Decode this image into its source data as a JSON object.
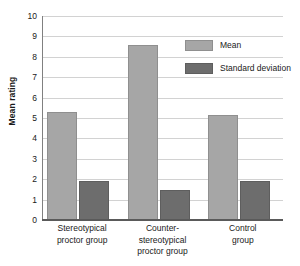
{
  "chart_data": {
    "type": "bar",
    "title": "",
    "xlabel": "",
    "ylabel": "Mean rating",
    "ylim": [
      0,
      10
    ],
    "yticks": [
      "10",
      "9",
      "8",
      "7",
      "6",
      "5",
      "4",
      "3",
      "2",
      "1",
      "0"
    ],
    "grid": true,
    "legend_position": "upper-right",
    "categories": [
      "Stereotypical proctor group",
      "Counter-stereotypical proctor group",
      "Control group"
    ],
    "category_lines": [
      [
        "Stereotypical",
        "proctor group"
      ],
      [
        "Counter-",
        "stereotypical",
        "proctor group"
      ],
      [
        "Control",
        "group"
      ]
    ],
    "series": [
      {
        "name": "Mean",
        "color": "#a6a6a6",
        "values": [
          5.3,
          8.6,
          5.15
        ]
      },
      {
        "name": "Standard deviation",
        "color": "#6d6d6d",
        "values": [
          1.9,
          1.45,
          1.9
        ]
      }
    ]
  },
  "legend": {
    "items": [
      {
        "label": "Mean",
        "key": "mean"
      },
      {
        "label": "Standard deviation",
        "key": "sd"
      }
    ]
  },
  "colors": {
    "mean_bar": "#a6a6a6",
    "sd_bar": "#6d6d6d",
    "gridline": "#d2d2d2",
    "axis": "#5a5a5a",
    "background": "#ffffff",
    "text": "#1a1a1a"
  }
}
